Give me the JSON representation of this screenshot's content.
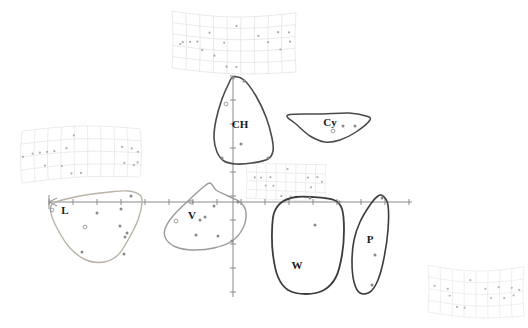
{
  "figure": {
    "title": "",
    "background_color": "#ffffff",
    "axis_color": "#8a8a8a",
    "point_color": "#8a8a8a",
    "label_color": "#1a1a1a"
  },
  "chart_data": {
    "type": "scatter",
    "title": "",
    "subtitle": "",
    "xlabel": "",
    "ylabel": "",
    "xlim": [
      -4.2,
      4.2
    ],
    "ylim": [
      -3.1,
      3.1
    ],
    "grid": false,
    "legend_position": "none",
    "axes": {
      "x_axis_pixel_y": 202,
      "y_axis_pixel_x": 233,
      "x_axis_start_pixel": 49,
      "x_axis_end_pixel": 412,
      "y_axis_start_pixel": 76,
      "y_axis_end_pixel": 297,
      "x_tick_count": 16,
      "y_tick_count": 10,
      "x_tick_spacing_px": 24,
      "y_tick_spacing_px": 24
    },
    "groups": [
      {
        "name": "CH",
        "label": "CH",
        "hull_color": "#4a4a4a",
        "hull_width": 1.6,
        "label_pixel": [
          240,
          128
        ],
        "hull_points": [
          [
            233,
            77
          ],
          [
            244,
            80
          ],
          [
            256,
            96
          ],
          [
            266,
            117
          ],
          [
            272,
            138
          ],
          [
            273,
            151
          ],
          [
            268,
            159
          ],
          [
            252,
            163
          ],
          [
            236,
            164
          ],
          [
            224,
            161
          ],
          [
            217,
            152
          ],
          [
            214,
            138
          ],
          [
            216,
            120
          ],
          [
            222,
            99
          ],
          [
            229,
            83
          ]
        ],
        "data_points": [
          {
            "x": 233,
            "y": 78,
            "style": "solid"
          },
          {
            "x": 244,
            "y": 81,
            "style": "solid"
          },
          {
            "x": 241,
            "y": 144,
            "style": "solid"
          },
          {
            "x": 268,
            "y": 158,
            "style": "solid"
          },
          {
            "x": 222,
            "y": 158,
            "style": "solid"
          },
          {
            "x": 226,
            "y": 104,
            "style": "open"
          }
        ],
        "n_points": 6
      },
      {
        "name": "Cy",
        "label": "Cy",
        "hull_color": "#4a4a4a",
        "hull_width": 1.5,
        "label_pixel": [
          330,
          126
        ],
        "hull_points": [
          [
            288,
            115
          ],
          [
            322,
            114
          ],
          [
            349,
            113
          ],
          [
            366,
            116
          ],
          [
            370,
            120
          ],
          [
            356,
            132
          ],
          [
            340,
            140
          ],
          [
            325,
            142
          ],
          [
            310,
            136
          ],
          [
            296,
            124
          ]
        ],
        "data_points": [
          {
            "x": 343,
            "y": 126,
            "style": "solid"
          },
          {
            "x": 355,
            "y": 126,
            "style": "solid"
          },
          {
            "x": 333,
            "y": 131,
            "style": "open"
          }
        ],
        "n_points": 3
      },
      {
        "name": "L",
        "label": "L",
        "hull_color": "#b9b2a6",
        "hull_width": 1.4,
        "label_pixel": [
          65,
          214
        ],
        "hull_points": [
          [
            54,
            203
          ],
          [
            80,
            196
          ],
          [
            110,
            192
          ],
          [
            128,
            191
          ],
          [
            140,
            195
          ],
          [
            142,
            203
          ],
          [
            138,
            220
          ],
          [
            128,
            240
          ],
          [
            118,
            255
          ],
          [
            104,
            262
          ],
          [
            86,
            260
          ],
          [
            70,
            248
          ],
          [
            58,
            230
          ],
          [
            51,
            213
          ]
        ],
        "data_points": [
          {
            "x": 97,
            "y": 213,
            "style": "solid"
          },
          {
            "x": 121,
            "y": 209,
            "style": "solid"
          },
          {
            "x": 120,
            "y": 226,
            "style": "solid"
          },
          {
            "x": 127,
            "y": 233,
            "style": "solid"
          },
          {
            "x": 125,
            "y": 237,
            "style": "solid"
          },
          {
            "x": 85,
            "y": 227,
            "style": "open"
          },
          {
            "x": 82,
            "y": 252,
            "style": "solid"
          },
          {
            "x": 124,
            "y": 254,
            "style": "solid"
          },
          {
            "x": 52,
            "y": 210,
            "style": "open"
          },
          {
            "x": 131,
            "y": 196,
            "style": "solid"
          }
        ],
        "n_points": 10
      },
      {
        "name": "V",
        "label": "V",
        "hull_color": "#9a9a9a",
        "hull_width": 1.4,
        "label_pixel": [
          192,
          219
        ],
        "hull_points": [
          [
            210,
            183
          ],
          [
            216,
            190
          ],
          [
            228,
            196
          ],
          [
            240,
            202
          ],
          [
            246,
            212
          ],
          [
            243,
            228
          ],
          [
            232,
            241
          ],
          [
            214,
            248
          ],
          [
            193,
            250
          ],
          [
            176,
            247
          ],
          [
            166,
            239
          ],
          [
            165,
            229
          ],
          [
            173,
            216
          ],
          [
            188,
            201
          ],
          [
            201,
            189
          ]
        ],
        "data_points": [
          {
            "x": 214,
            "y": 206,
            "style": "solid"
          },
          {
            "x": 205,
            "y": 217,
            "style": "solid"
          },
          {
            "x": 200,
            "y": 220,
            "style": "solid"
          },
          {
            "x": 191,
            "y": 202,
            "style": "open"
          },
          {
            "x": 176,
            "y": 221,
            "style": "open"
          },
          {
            "x": 196,
            "y": 235,
            "style": "solid"
          },
          {
            "x": 218,
            "y": 236,
            "style": "solid"
          },
          {
            "x": 232,
            "y": 241,
            "style": "solid"
          },
          {
            "x": 238,
            "y": 202,
            "style": "solid"
          }
        ],
        "n_points": 9
      },
      {
        "name": "W",
        "label": "W",
        "hull_color": "#3c3c3c",
        "hull_width": 1.8,
        "label_pixel": [
          297,
          269
        ],
        "hull_points": [
          [
            312,
            197
          ],
          [
            334,
            200
          ],
          [
            342,
            209
          ],
          [
            344,
            230
          ],
          [
            342,
            255
          ],
          [
            336,
            277
          ],
          [
            324,
            290
          ],
          [
            306,
            294
          ],
          [
            288,
            290
          ],
          [
            278,
            277
          ],
          [
            273,
            255
          ],
          [
            272,
            232
          ],
          [
            274,
            213
          ],
          [
            282,
            202
          ],
          [
            296,
            197
          ]
        ],
        "data_points": [
          {
            "x": 315,
            "y": 225,
            "style": "solid"
          },
          {
            "x": 339,
            "y": 202,
            "style": "solid"
          },
          {
            "x": 310,
            "y": 198,
            "style": "solid"
          }
        ],
        "n_points": 3
      },
      {
        "name": "P",
        "label": "P",
        "hull_color": "#3c3c3c",
        "hull_width": 1.6,
        "label_pixel": [
          370,
          243
        ],
        "hull_points": [
          [
            383,
            196
          ],
          [
            388,
            205
          ],
          [
            388,
            230
          ],
          [
            384,
            258
          ],
          [
            378,
            280
          ],
          [
            370,
            292
          ],
          [
            360,
            293
          ],
          [
            354,
            282
          ],
          [
            352,
            262
          ],
          [
            354,
            240
          ],
          [
            360,
            222
          ],
          [
            370,
            205
          ],
          [
            378,
            196
          ]
        ],
        "data_points": [
          {
            "x": 375,
            "y": 255,
            "style": "solid"
          },
          {
            "x": 372,
            "y": 285,
            "style": "solid"
          },
          {
            "x": 382,
            "y": 198,
            "style": "solid"
          }
        ],
        "n_points": 3
      }
    ],
    "deformation_grids": [
      {
        "name": "grid-top",
        "position_pixel": [
          172,
          12
        ],
        "width": 124,
        "height": 58,
        "cols": 9,
        "rows": 5,
        "color": "#d9d9dc",
        "point_color": "#a9a9ad",
        "warp": "bow-down",
        "points": [
          [
            0.52,
            0.16
          ],
          [
            0.7,
            0.34
          ],
          [
            0.86,
            0.3
          ],
          [
            0.95,
            0.32
          ],
          [
            0.3,
            0.3
          ],
          [
            0.08,
            0.52
          ],
          [
            0.14,
            0.5
          ],
          [
            0.2,
            0.48
          ],
          [
            0.24,
            0.62
          ],
          [
            0.78,
            0.46
          ],
          [
            0.42,
            0.46
          ],
          [
            0.34,
            0.7
          ],
          [
            0.44,
            0.88
          ],
          [
            0.52,
            0.88
          ],
          [
            0.88,
            0.6
          ],
          [
            0.06,
            0.56
          ],
          [
            0.96,
            0.48
          ]
        ]
      },
      {
        "name": "grid-left",
        "position_pixel": [
          22,
          130
        ],
        "width": 118,
        "height": 50,
        "cols": 9,
        "rows": 4,
        "color": "#dcdce0",
        "point_color": "#aeaeb4",
        "warp": "bow-up",
        "points": [
          [
            0.44,
            0.18
          ],
          [
            0.1,
            0.46
          ],
          [
            0.16,
            0.46
          ],
          [
            0.22,
            0.46
          ],
          [
            0.28,
            0.46
          ],
          [
            0.38,
            0.42
          ],
          [
            0.84,
            0.4
          ],
          [
            0.92,
            0.42
          ],
          [
            0.97,
            0.48
          ],
          [
            0.2,
            0.72
          ],
          [
            0.34,
            0.76
          ],
          [
            0.86,
            0.72
          ],
          [
            0.94,
            0.76
          ],
          [
            0.42,
            0.92
          ],
          [
            0.5,
            0.92
          ],
          [
            0.02,
            0.5
          ],
          [
            0.97,
            0.7
          ]
        ]
      },
      {
        "name": "grid-mid-right",
        "position_pixel": [
          246,
          164
        ],
        "width": 80,
        "height": 36,
        "cols": 8,
        "rows": 4,
        "color": "#dedee2",
        "point_color": "#b0b0b6",
        "warp": "flat",
        "points": [
          [
            0.52,
            0.14
          ],
          [
            0.1,
            0.4
          ],
          [
            0.18,
            0.4
          ],
          [
            0.3,
            0.38
          ],
          [
            0.78,
            0.36
          ],
          [
            0.9,
            0.34
          ],
          [
            0.24,
            0.62
          ],
          [
            0.34,
            0.62
          ],
          [
            0.82,
            0.62
          ],
          [
            0.44,
            0.9
          ],
          [
            0.56,
            0.9
          ],
          [
            0.96,
            0.46
          ]
        ]
      },
      {
        "name": "grid-bottom-right",
        "position_pixel": [
          428,
          266
        ],
        "width": 96,
        "height": 48,
        "cols": 8,
        "rows": 4,
        "color": "#e2e2e6",
        "point_color": "#b6b6bb",
        "warp": "bow-down",
        "points": [
          [
            0.44,
            0.2
          ],
          [
            0.06,
            0.42
          ],
          [
            0.2,
            0.44
          ],
          [
            0.6,
            0.38
          ],
          [
            0.74,
            0.36
          ],
          [
            0.88,
            0.4
          ],
          [
            0.22,
            0.58
          ],
          [
            0.66,
            0.58
          ],
          [
            0.8,
            0.6
          ],
          [
            0.9,
            0.56
          ],
          [
            0.3,
            0.8
          ],
          [
            0.38,
            0.8
          ],
          [
            0.96,
            0.46
          ]
        ]
      }
    ],
    "axis_arrow": {
      "present": true,
      "position_pixel": [
        49,
        202
      ],
      "direction": "left-origin-marker"
    }
  },
  "watermark": {
    "text": "",
    "position_pixel": [
      58,
      308
    ],
    "visible": false
  }
}
